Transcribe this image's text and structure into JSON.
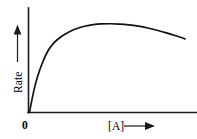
{
  "figure": {
    "background_color": "#ffffff",
    "ink_color": "#111111",
    "width": 197,
    "height": 139
  },
  "axes": {
    "y_axis": {
      "label": "Rate",
      "arrow": "up-arrow",
      "x_px": 28,
      "top_px": 8,
      "bottom_px": 112
    },
    "x_axis": {
      "label": "[A]",
      "arrow": "right-arrow",
      "y_px": 112,
      "left_px": 28,
      "right_px": 197
    },
    "origin_label": "0"
  },
  "chart_data": {
    "type": "line",
    "title": "",
    "xlabel": "[A]",
    "ylabel": "Rate",
    "grid": false,
    "legend": null,
    "xlim": [
      0,
      100
    ],
    "ylim": [
      0,
      100
    ],
    "axis_ticks": {
      "x": [
        "0"
      ],
      "y": []
    },
    "annotations": [],
    "series": [
      {
        "name": "Rate vs [A]",
        "color": "#111111",
        "x": [
          0,
          1.5,
          3,
          5,
          8,
          12,
          16,
          21,
          26,
          31,
          36,
          41,
          46,
          52,
          58,
          64,
          70,
          76,
          82,
          88,
          94,
          100
        ],
        "y": [
          0,
          13,
          25,
          38,
          53,
          68,
          77,
          84,
          89,
          92.5,
          95,
          96.5,
          97.3,
          97.5,
          97.2,
          96.3,
          94.8,
          92.8,
          90.3,
          87.4,
          84.2,
          80.8
        ]
      }
    ]
  }
}
